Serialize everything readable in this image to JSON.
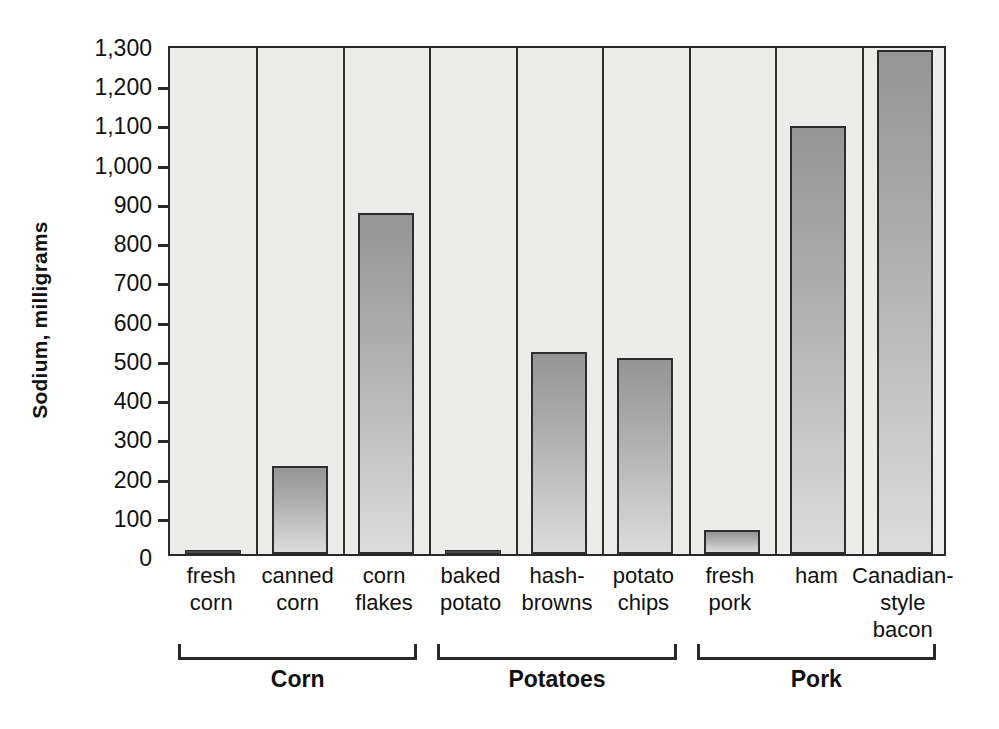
{
  "chart_data": {
    "type": "bar",
    "title": "",
    "subtitle": "",
    "xlabel": "",
    "ylabel": "Sodium, milligrams",
    "ylim": [
      0,
      1300
    ],
    "ytick_step": 100,
    "grid": false,
    "legend": "none",
    "categories": [
      "fresh\ncorn",
      "canned\ncorn",
      "corn\nflakes",
      "baked\npotato",
      "hash-\nbrowns",
      "potato\nchips",
      "fresh\npork",
      "ham",
      "Canadian-\nstyle\nbacon"
    ],
    "category_lines": [
      [
        "fresh",
        "corn"
      ],
      [
        "canned",
        "corn"
      ],
      [
        "corn",
        "flakes"
      ],
      [
        "baked",
        "potato"
      ],
      [
        "hash-",
        "browns"
      ],
      [
        "potato",
        "chips"
      ],
      [
        "fresh",
        "pork"
      ],
      [
        "ham"
      ],
      [
        "Canadian-",
        "style",
        "bacon"
      ]
    ],
    "values": [
      5,
      225,
      870,
      8,
      515,
      500,
      60,
      1090,
      1285
    ],
    "ytick_labels": [
      "0",
      "100",
      "200",
      "300",
      "400",
      "500",
      "600",
      "700",
      "800",
      "900",
      "1,000",
      "1,100",
      "1,200",
      "1,300"
    ],
    "ytick_values": [
      0,
      100,
      200,
      300,
      400,
      500,
      600,
      700,
      800,
      900,
      1000,
      1100,
      1200,
      1300
    ],
    "groups": [
      {
        "label": "Corn",
        "start_index": 0,
        "end_index": 2
      },
      {
        "label": "Potatoes",
        "start_index": 3,
        "end_index": 5
      },
      {
        "label": "Pork",
        "start_index": 6,
        "end_index": 8
      }
    ],
    "colors": {
      "plot_background": "#ececeb",
      "bar_top": "#959595",
      "bar_bottom": "#dcdcdc",
      "bar_outline": "#2d2d2d",
      "axis": "#2a2a2a",
      "text": "#111111",
      "page_background": "#ffffff"
    }
  }
}
